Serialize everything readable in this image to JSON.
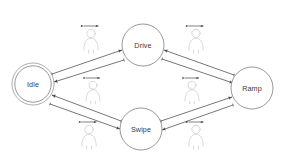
{
  "diagram": {
    "type": "state-machine-diagram",
    "title": "",
    "background_color": "#ffffff",
    "node_stroke_color": "#8d8d8d",
    "edge_color": "#4a4a4a",
    "actor_color": "#c9c9c9",
    "label_color": "#3a3a3a",
    "nodes": [
      {
        "id": "idle",
        "label": "Idle",
        "cx": 33,
        "cy": 84,
        "r": 21,
        "initial_state": true,
        "icon": "state-circle-double"
      },
      {
        "id": "drive",
        "label": "Drive",
        "cx": 143,
        "cy": 45,
        "r": 21,
        "initial_state": false,
        "icon": "state-circle"
      },
      {
        "id": "ramp",
        "label": "Ramp",
        "cx": 252,
        "cy": 88,
        "r": 21,
        "initial_state": false,
        "icon": "state-circle"
      },
      {
        "id": "swipe",
        "label": "Swipe",
        "cx": 141,
        "cy": 129,
        "r": 21,
        "initial_state": false,
        "icon": "state-circle"
      }
    ],
    "edges": [
      {
        "id": "idle-to-drive",
        "from": "idle",
        "to": "drive",
        "direction": "forward"
      },
      {
        "id": "drive-to-idle",
        "from": "drive",
        "to": "idle",
        "direction": "forward"
      },
      {
        "id": "drive-to-ramp",
        "from": "drive",
        "to": "ramp",
        "direction": "forward"
      },
      {
        "id": "ramp-to-drive",
        "from": "ramp",
        "to": "drive",
        "direction": "forward"
      },
      {
        "id": "idle-to-swipe",
        "from": "idle",
        "to": "swipe",
        "direction": "forward"
      },
      {
        "id": "swipe-to-idle",
        "from": "swipe",
        "to": "idle",
        "direction": "forward"
      },
      {
        "id": "swipe-to-ramp",
        "from": "swipe",
        "to": "ramp",
        "direction": "forward"
      },
      {
        "id": "ramp-to-swipe",
        "from": "ramp",
        "to": "swipe",
        "direction": "forward"
      }
    ],
    "actors": [
      {
        "id": "actor-idle-drive-upper",
        "x": 91,
        "y": 26,
        "icon": "person-with-bidirectional-arrow"
      },
      {
        "id": "actor-drive-ramp-upper",
        "x": 196,
        "y": 26,
        "icon": "person-with-bidirectional-arrow"
      },
      {
        "id": "actor-idle-drive-lower",
        "x": 93,
        "y": 78,
        "icon": "person-with-bidirectional-arrow"
      },
      {
        "id": "actor-drive-ramp-lower",
        "x": 192,
        "y": 78,
        "icon": "person-with-bidirectional-arrow"
      },
      {
        "id": "actor-idle-swipe-lower",
        "x": 89,
        "y": 122,
        "icon": "person-with-bidirectional-arrow"
      },
      {
        "id": "actor-swipe-ramp-lower",
        "x": 196,
        "y": 122,
        "icon": "person-with-bidirectional-arrow"
      }
    ]
  }
}
